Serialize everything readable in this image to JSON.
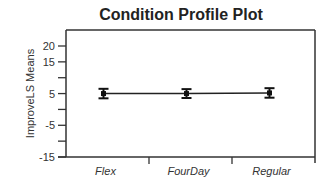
{
  "chart_data": {
    "type": "line",
    "title": "Condition Profile Plot",
    "xlabel": "",
    "ylabel": "ImproveLS Means",
    "categories": [
      "Flex",
      "FourDay",
      "Regular"
    ],
    "series": [
      {
        "name": "ImproveLS Means",
        "values": [
          5.0,
          5.0,
          5.2
        ],
        "error_low": [
          3.5,
          3.6,
          3.7
        ],
        "error_high": [
          6.5,
          6.4,
          6.7
        ]
      }
    ],
    "ylim": [
      -15,
      25
    ],
    "yticks": [
      20,
      15,
      10,
      5,
      0,
      -5,
      -10,
      -15
    ],
    "ytick_labels": [
      "20",
      "15",
      "",
      "5",
      "",
      "-5",
      "",
      "-15"
    ],
    "grid": false,
    "legend": null
  }
}
